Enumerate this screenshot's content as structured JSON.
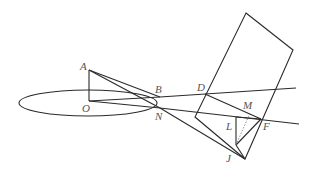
{
  "diagram": {
    "type": "geometry",
    "stroke_color": "#2a2a2a",
    "label_color": "#555555",
    "labels": {
      "A": "A",
      "O": "O",
      "B": "B",
      "N": "N",
      "D": "D",
      "M": "M",
      "L": "L",
      "F": "F",
      "J": "J"
    },
    "points": {
      "A": [
        89,
        70
      ],
      "O": [
        89,
        101
      ],
      "B": [
        160,
        97
      ],
      "N": [
        160,
        108
      ],
      "D": [
        205,
        94
      ],
      "M": [
        248,
        112
      ],
      "L": [
        236,
        117
      ],
      "F": [
        261,
        119
      ],
      "J": [
        236,
        145
      ]
    },
    "ellipse": {
      "cx": 88,
      "cy": 103,
      "rx": 69,
      "ry": 13
    },
    "rectangle": [
      [
        246,
        13
      ],
      [
        293,
        50
      ],
      [
        245,
        159
      ],
      [
        195,
        117
      ]
    ]
  }
}
